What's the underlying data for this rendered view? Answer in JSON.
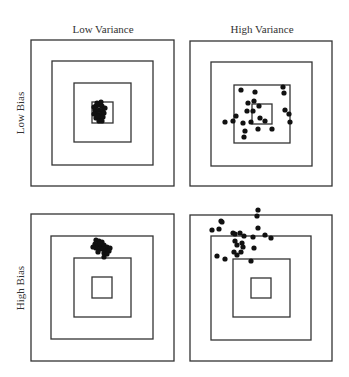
{
  "diagram": {
    "column_labels": [
      "Low Variance",
      "High Variance"
    ],
    "row_labels": [
      "Low Bias",
      "High Bias"
    ],
    "colors": {
      "line": "#333333",
      "dot": "#111111",
      "text": "#333333",
      "background": "#ffffff"
    },
    "panels": [
      {
        "id": "low-bias-low-variance",
        "squares": [
          [
            31,
            40,
            174,
            186
          ],
          [
            52,
            61,
            153,
            165
          ],
          [
            74,
            83,
            131,
            142
          ],
          [
            92,
            102,
            113,
            123
          ]
        ],
        "dots": [
          [
            96,
            106
          ],
          [
            99,
            105
          ],
          [
            102,
            106
          ],
          [
            95,
            110
          ],
          [
            99,
            110
          ],
          [
            103,
            110
          ],
          [
            97,
            114
          ],
          [
            101,
            114
          ],
          [
            104,
            113
          ],
          [
            96,
            118
          ],
          [
            100,
            118
          ],
          [
            103,
            117
          ],
          [
            99,
            121
          ],
          [
            102,
            121
          ],
          [
            97,
            103
          ],
          [
            94,
            107
          ],
          [
            94,
            114
          ],
          [
            101,
            102
          ],
          [
            105,
            108
          ],
          [
            98,
            116
          ]
        ]
      },
      {
        "id": "low-bias-high-variance",
        "squares": [
          [
            190,
            41,
            332,
            186
          ],
          [
            211,
            62,
            312,
            166
          ],
          [
            234,
            85,
            290,
            143
          ],
          [
            252,
            104,
            272,
            124
          ]
        ],
        "dots": [
          [
            241,
            90
          ],
          [
            255,
            92
          ],
          [
            283,
            87
          ],
          [
            284,
            93
          ],
          [
            248,
            103
          ],
          [
            254,
            101
          ],
          [
            247,
            111
          ],
          [
            253,
            111
          ],
          [
            259,
            106
          ],
          [
            236,
            116
          ],
          [
            233,
            121
          ],
          [
            225,
            122
          ],
          [
            251,
            122
          ],
          [
            260,
            118
          ],
          [
            265,
            121
          ],
          [
            258,
            129
          ],
          [
            245,
            131
          ],
          [
            272,
            129
          ],
          [
            244,
            137
          ],
          [
            285,
            110
          ],
          [
            289,
            114
          ],
          [
            290,
            122
          ],
          [
            243,
            123
          ]
        ]
      },
      {
        "id": "high-bias-low-variance",
        "squares": [
          [
            31,
            214,
            174,
            361
          ],
          [
            51,
            236,
            153,
            339
          ],
          [
            74,
            258,
            131,
            317
          ],
          [
            92,
            277,
            112,
            298
          ]
        ],
        "dots": [
          [
            96,
            240
          ],
          [
            99,
            241
          ],
          [
            102,
            242
          ],
          [
            95,
            244
          ],
          [
            98,
            245
          ],
          [
            101,
            245
          ],
          [
            104,
            245
          ],
          [
            107,
            247
          ],
          [
            110,
            248
          ],
          [
            96,
            248
          ],
          [
            100,
            249
          ],
          [
            103,
            249
          ],
          [
            106,
            251
          ],
          [
            109,
            251
          ],
          [
            98,
            252
          ],
          [
            104,
            253
          ],
          [
            107,
            254
          ],
          [
            104,
            257
          ],
          [
            100,
            243
          ],
          [
            93,
            247
          ]
        ]
      },
      {
        "id": "high-bias-high-variance",
        "squares": [
          [
            190,
            215,
            332,
            361
          ],
          [
            211,
            236,
            311,
            340
          ],
          [
            233,
            259,
            290,
            317
          ],
          [
            251,
            278,
            271,
            298
          ]
        ],
        "dots": [
          [
            258,
            210
          ],
          [
            257,
            216
          ],
          [
            221,
            221
          ],
          [
            222,
            222
          ],
          [
            212,
            230
          ],
          [
            219,
            229
          ],
          [
            258,
            228
          ],
          [
            233,
            233
          ],
          [
            235,
            234
          ],
          [
            240,
            233
          ],
          [
            244,
            236
          ],
          [
            253,
            237
          ],
          [
            265,
            235
          ],
          [
            271,
            238
          ],
          [
            235,
            241
          ],
          [
            237,
            245
          ],
          [
            242,
            243
          ],
          [
            243,
            247
          ],
          [
            241,
            252
          ],
          [
            254,
            248
          ],
          [
            217,
            256
          ],
          [
            234,
            252
          ],
          [
            237,
            255
          ],
          [
            225,
            259
          ],
          [
            251,
            261
          ]
        ]
      }
    ]
  }
}
